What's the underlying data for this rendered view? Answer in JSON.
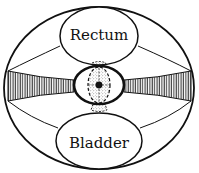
{
  "diagram": {
    "type": "anatomical cross-section (pelvis, uterus with broad ligaments)",
    "labels": {
      "top_organ": "Rectum",
      "bottom_organ": "Bladder"
    },
    "colors": {
      "stroke": "#111111",
      "background": "#ffffff",
      "stipple": "#555555"
    }
  }
}
